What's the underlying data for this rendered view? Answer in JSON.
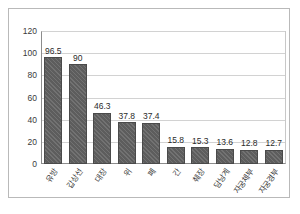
{
  "chart_data": {
    "type": "bar",
    "title": "",
    "xlabel": "",
    "ylabel": "",
    "categories": [
      "유방",
      "갑상선",
      "대장",
      "위",
      "폐",
      "간",
      "췌장",
      "담낭계",
      "자궁체부",
      "자궁경부"
    ],
    "values": [
      96.5,
      90,
      46.3,
      37.8,
      37.4,
      15.8,
      15.3,
      13.6,
      12.8,
      12.7
    ],
    "value_labels": [
      "96.5",
      "90",
      "46.3",
      "37.8",
      "37.4",
      "15.8",
      "15.3",
      "13.6",
      "12.8",
      "12.7"
    ],
    "ylim": [
      0,
      120
    ],
    "ytick_labels": [
      "0",
      "20",
      "40",
      "60",
      "80",
      "100",
      "120"
    ],
    "ytick_values": [
      0,
      20,
      40,
      60,
      80,
      100,
      120
    ],
    "grid": true,
    "legend": false,
    "legend_position": "none",
    "bar_color": "#5d5d5d",
    "gridline_color": "#d2d2d2",
    "axis_color": "#8c8c8c",
    "frame_color": "#b9b9b9",
    "text_color": "#3a3a3a"
  }
}
